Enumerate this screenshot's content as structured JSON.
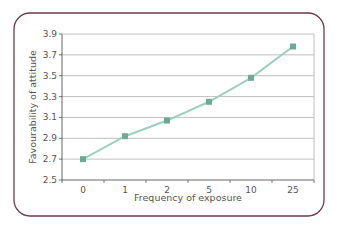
{
  "chart_data": {
    "type": "line",
    "title": "",
    "xlabel": "Frequency of exposure",
    "ylabel": "Favourability of attitude",
    "categories": [
      "0",
      "1",
      "2",
      "5",
      "10",
      "25"
    ],
    "series": [
      {
        "name": "Favourability of attitude",
        "values": [
          2.7,
          2.92,
          3.07,
          3.25,
          3.48,
          3.78
        ]
      }
    ],
    "yticks": [
      "2.5",
      "2.7",
      "2.9",
      "3.1",
      "3.3",
      "3.5",
      "3.7",
      "3.9"
    ],
    "ylim": [
      2.5,
      3.9
    ],
    "grid": true,
    "legend": "none",
    "colors": {
      "line": "#9dcfc0",
      "marker": "#6aab98",
      "grid": "#b0b0b0",
      "axis": "#555555",
      "frame": "#6b3a4a"
    }
  }
}
